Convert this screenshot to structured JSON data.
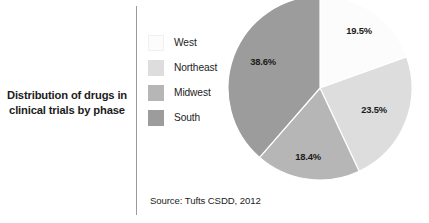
{
  "figure": {
    "title": "Distribution of drugs in clinical trials by phase",
    "source": "Source: Tufts CSDD, 2012"
  },
  "legend": {
    "items": [
      {
        "label": "West",
        "color": "#fcfcfc"
      },
      {
        "label": "Northeast",
        "color": "#dddddd"
      },
      {
        "label": "Midwest",
        "color": "#b6b6b6"
      },
      {
        "label": "South",
        "color": "#9c9c9c"
      }
    ]
  },
  "chart_data": {
    "type": "pie",
    "title": "Distribution of drugs in clinical trials by phase",
    "subtitle": "",
    "xlabel": "",
    "ylabel": "",
    "legend_position": "left",
    "grid": false,
    "start_angle_deg": 0,
    "direction": "clockwise",
    "categories": [
      "West",
      "Northeast",
      "Midwest",
      "South"
    ],
    "values": [
      19.5,
      23.5,
      18.4,
      38.6
    ],
    "value_labels": [
      "19.5%",
      "23.5%",
      "18.4%",
      "38.6%"
    ],
    "colors": [
      "#fcfcfc",
      "#dddddd",
      "#b6b6b6",
      "#9c9c9c"
    ],
    "slices": [
      {
        "name": "West",
        "value": 19.5,
        "label": "19.5%",
        "color": "#fcfcfc",
        "label_x": 137,
        "label_y": 44
      },
      {
        "name": "Northeast",
        "value": 23.5,
        "label": "23.5%",
        "color": "#dddddd",
        "label_x": 152,
        "label_y": 123
      },
      {
        "name": "Midwest",
        "value": 18.4,
        "label": "18.4%",
        "color": "#b6b6b6",
        "label_x": 86,
        "label_y": 170
      },
      {
        "name": "South",
        "value": 38.6,
        "label": "38.6%",
        "color": "#9c9c9c",
        "label_x": 41,
        "label_y": 75
      }
    ],
    "annotations": [
      "Source: Tufts CSDD, 2012"
    ]
  }
}
